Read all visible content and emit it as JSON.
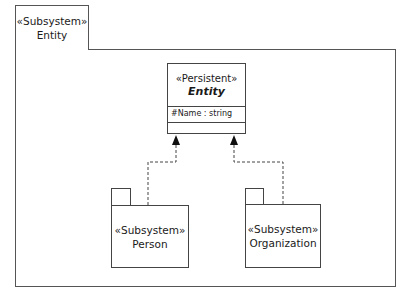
{
  "frame": {
    "stereotype": "«Subsystem»",
    "name": "Entity"
  },
  "class": {
    "stereotype": "«Persistent»",
    "name": "Entity",
    "attributes": [
      "#Name : string"
    ],
    "operations": []
  },
  "packages": [
    {
      "stereotype": "«Subsystem»",
      "name": "Person"
    },
    {
      "stereotype": "«Subsystem»",
      "name": "Organization"
    }
  ],
  "relationships": [
    {
      "type": "dependency",
      "from": "Person",
      "to": "Entity",
      "style": "dashed",
      "arrow": "filled"
    },
    {
      "type": "dependency",
      "from": "Organization",
      "to": "Entity",
      "style": "dashed",
      "arrow": "filled"
    }
  ],
  "colors": {
    "line": "#444444",
    "background": "#ffffff"
  }
}
